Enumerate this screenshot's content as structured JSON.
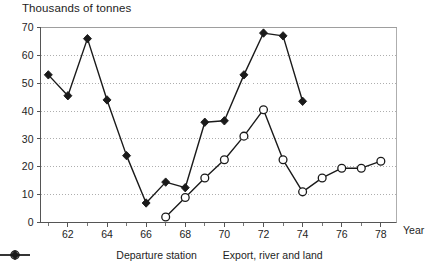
{
  "chart_data": {
    "type": "line",
    "title": "Thousands of tonnes",
    "xlabel": "Year",
    "ylabel": "Thousands of tonnes",
    "x": [
      1961,
      1962,
      1963,
      1964,
      1965,
      1966,
      1967,
      1968,
      1969,
      1970,
      1971,
      1972,
      1973,
      1974,
      1975,
      1976,
      1977,
      1978
    ],
    "tick_labels_x": [
      "62",
      "64",
      "66",
      "68",
      "70",
      "72",
      "74",
      "76",
      "78"
    ],
    "tick_values_x": [
      1962,
      1964,
      1966,
      1968,
      1970,
      1972,
      1974,
      1976,
      1978
    ],
    "tick_labels_y": [
      "0",
      "10",
      "20",
      "30",
      "40",
      "50",
      "60",
      "70"
    ],
    "tick_values_y": [
      0,
      10,
      20,
      30,
      40,
      50,
      60,
      70
    ],
    "xlim": [
      1960.6,
      1978.8
    ],
    "ylim": [
      0,
      70
    ],
    "grid": true,
    "grid_axis": "y",
    "legend_position": "bottom",
    "series": [
      {
        "name": "Departure station",
        "marker": "open-circle",
        "color": "#1a1a1a",
        "x": [
          1967,
          1968,
          1969,
          1970,
          1971,
          1972,
          1973,
          1974,
          1975,
          1976,
          1977,
          1978
        ],
        "values": [
          2,
          9,
          16,
          22.5,
          31,
          40.5,
          22.5,
          11,
          16,
          19.5,
          19.5,
          22
        ]
      },
      {
        "name": "Export, river and land",
        "marker": "filled-diamond",
        "color": "#1a1a1a",
        "x": [
          1961,
          1962,
          1963,
          1964,
          1965,
          1966,
          1967,
          1968,
          1969,
          1970,
          1971,
          1972,
          1973,
          1974
        ],
        "values": [
          53,
          45.5,
          66,
          44,
          24,
          7,
          14.5,
          12.5,
          36,
          36.5,
          53,
          68,
          67,
          43.5
        ]
      }
    ]
  },
  "axis": {
    "title_text": "Thousands of tonnes",
    "x_axis_title": "Year"
  },
  "legend": {
    "items": [
      {
        "label": "Departure station",
        "marker": "open-circle"
      },
      {
        "label": "Export, river and land",
        "marker": "filled-diamond"
      }
    ]
  }
}
